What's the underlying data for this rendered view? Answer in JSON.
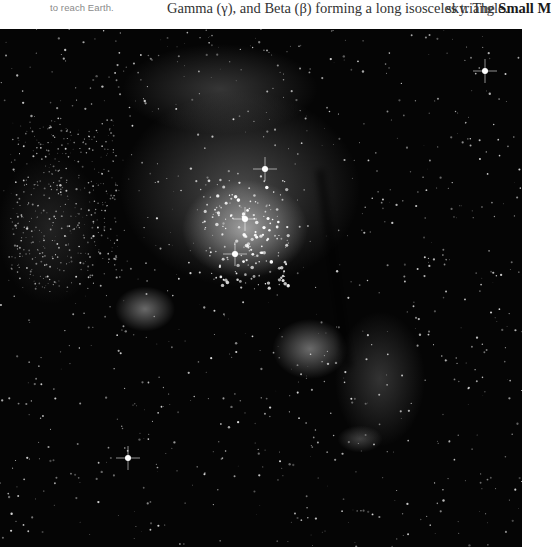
{
  "page": {
    "caption_fragment": "to reach Earth.",
    "column_middle_fragment": "Gamma (γ), and Beta (β) forming a long isosceles triangle.",
    "column_right_prefix": "sky. The ",
    "column_right_bold": "Small M"
  },
  "photo": {
    "subject": "Star-forming nebula with star cluster (astronomical photograph)",
    "tone": "grayscale",
    "background_color": "#050505"
  }
}
